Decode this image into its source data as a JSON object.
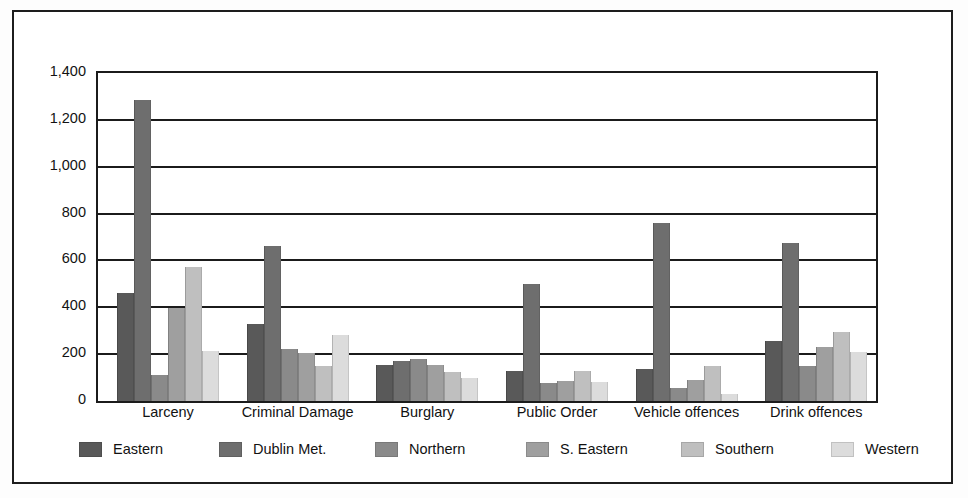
{
  "chart_data": {
    "type": "bar",
    "title": "",
    "subtitle": "",
    "xlabel": "",
    "ylabel": "",
    "ylim": [
      0,
      1400
    ],
    "yticks": [
      0,
      200,
      400,
      600,
      800,
      1000,
      1200,
      1400
    ],
    "ytick_labels": [
      "0",
      "200",
      "400",
      "600",
      "800",
      "1,000",
      "1,200",
      "1,400"
    ],
    "grid": true,
    "legend_position": "bottom",
    "categories": [
      "Larceny",
      "Criminal Damage",
      "Burglary",
      "Public Order",
      "Vehicle offences",
      "Drink offences"
    ],
    "series": [
      {
        "name": "Eastern",
        "color": "#595959",
        "values": [
          460,
          330,
          155,
          130,
          135,
          255
        ]
      },
      {
        "name": "Dublin Met.",
        "color": "#6e6e6e",
        "values": [
          1285,
          660,
          170,
          500,
          760,
          675
        ]
      },
      {
        "name": "Northern",
        "color": "#8a8a8a",
        "values": [
          110,
          220,
          180,
          75,
          55,
          150
        ]
      },
      {
        "name": "S. Eastern",
        "color": "#9f9f9f",
        "values": [
          395,
          205,
          155,
          85,
          90,
          230
        ]
      },
      {
        "name": "Southern",
        "color": "#bfbfbf",
        "values": [
          570,
          150,
          125,
          130,
          150,
          295
        ]
      },
      {
        "name": "Western",
        "color": "#dcdcdc",
        "values": [
          215,
          280,
          100,
          80,
          30,
          210
        ]
      }
    ]
  },
  "legend": {
    "items": [
      {
        "label": "Eastern"
      },
      {
        "label": "Dublin Met."
      },
      {
        "label": "Northern"
      },
      {
        "label": "S. Eastern"
      },
      {
        "label": "Southern"
      },
      {
        "label": "Western"
      }
    ]
  }
}
